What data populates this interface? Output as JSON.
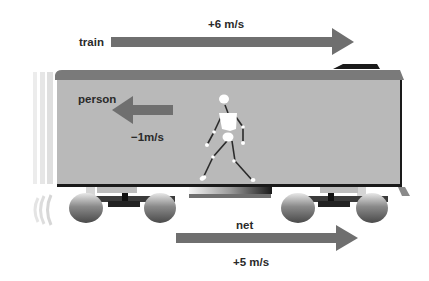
{
  "diagram": {
    "train": {
      "label": "train",
      "velocity_label": "+6 m/s",
      "velocity": 6,
      "direction": "right"
    },
    "person": {
      "label": "person",
      "velocity_label": "−1m/s",
      "velocity": -1,
      "direction": "left"
    },
    "net": {
      "label": "net",
      "velocity_label": "+5 m/s",
      "velocity": 5,
      "direction": "right"
    },
    "colors": {
      "arrow": "#6f6f6f",
      "car_body": "#b9b9b9",
      "car_roof": "#7a7a7a",
      "figure": "#ffffff",
      "text": "#2a2a2a"
    }
  }
}
